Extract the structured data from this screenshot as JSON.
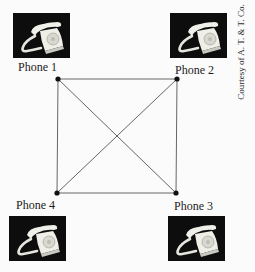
{
  "diagram": {
    "type": "complete-graph",
    "nodes": [
      {
        "id": "phone-1",
        "label": "Phone 1",
        "x": 58,
        "y": 79
      },
      {
        "id": "phone-2",
        "label": "Phone 2",
        "x": 177,
        "y": 79
      },
      {
        "id": "phone-3",
        "label": "Phone 3",
        "x": 176,
        "y": 193
      },
      {
        "id": "phone-4",
        "label": "Phone 4",
        "x": 57,
        "y": 193
      }
    ],
    "edges": [
      [
        "phone-1",
        "phone-2"
      ],
      [
        "phone-2",
        "phone-3"
      ],
      [
        "phone-3",
        "phone-4"
      ],
      [
        "phone-4",
        "phone-1"
      ],
      [
        "phone-1",
        "phone-3"
      ],
      [
        "phone-2",
        "phone-4"
      ]
    ],
    "edge_color": "#555555",
    "node_color": "#111111"
  },
  "labels": {
    "phone_1": "Phone 1",
    "phone_2": "Phone 2",
    "phone_3": "Phone 3",
    "phone_4": "Phone 4"
  },
  "photos": [
    {
      "id": "phone-1-photo",
      "icon": "telephone-icon"
    },
    {
      "id": "phone-2-photo",
      "icon": "telephone-icon"
    },
    {
      "id": "phone-3-photo",
      "icon": "telephone-icon"
    },
    {
      "id": "phone-4-photo",
      "icon": "telephone-icon"
    }
  ],
  "credit": "Courtesy of A. T. & T. Co."
}
